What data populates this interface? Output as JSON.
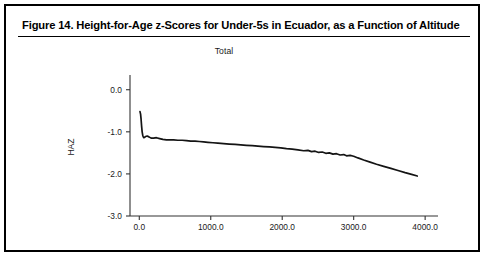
{
  "figure": {
    "title": "Figure 14.  Height-for-Age z-Scores for Under-5s in Ecuador, as a Function of Altitude",
    "subtitle": "Total"
  },
  "chart_data": {
    "type": "line",
    "title": "Total",
    "xlabel": "",
    "ylabel": "HAZ",
    "xlim": [
      -130,
      4180
    ],
    "ylim": [
      -3.0,
      0.35
    ],
    "grid": false,
    "legend": null,
    "xticks": [
      0,
      1000,
      2000,
      3000,
      4000
    ],
    "xtick_labels": [
      "0.0",
      "1000.0",
      "2000.0",
      "3000.0",
      "4000.0"
    ],
    "yticks": [
      0.0,
      -1.0,
      -2.0,
      -3.0
    ],
    "ytick_labels": [
      "0.0",
      "-1.0",
      "-2.0",
      "-3.0"
    ],
    "series": [
      {
        "name": "Total",
        "x": [
          10,
          18,
          25,
          32,
          40,
          48,
          56,
          64,
          75,
          90,
          110,
          135,
          165,
          200,
          240,
          285,
          330,
          380,
          430,
          480,
          540,
          600,
          660,
          720,
          780,
          840,
          900,
          960,
          1030,
          1100,
          1180,
          1260,
          1340,
          1420,
          1500,
          1580,
          1660,
          1740,
          1820,
          1900,
          1980,
          2060,
          2140,
          2220,
          2300,
          2360,
          2410,
          2460,
          2510,
          2560,
          2610,
          2660,
          2710,
          2760,
          2810,
          2860,
          2900,
          2950,
          3000,
          3060,
          3140,
          3230,
          3320,
          3420,
          3520,
          3620,
          3720,
          3810,
          3890
        ],
        "y": [
          -0.52,
          -0.58,
          -0.7,
          -0.86,
          -1.0,
          -1.08,
          -1.12,
          -1.14,
          -1.13,
          -1.11,
          -1.1,
          -1.12,
          -1.15,
          -1.15,
          -1.14,
          -1.16,
          -1.18,
          -1.19,
          -1.19,
          -1.19,
          -1.2,
          -1.2,
          -1.21,
          -1.22,
          -1.22,
          -1.23,
          -1.24,
          -1.25,
          -1.26,
          -1.27,
          -1.28,
          -1.29,
          -1.3,
          -1.31,
          -1.32,
          -1.33,
          -1.34,
          -1.35,
          -1.36,
          -1.37,
          -1.38,
          -1.4,
          -1.41,
          -1.43,
          -1.45,
          -1.44,
          -1.47,
          -1.46,
          -1.49,
          -1.48,
          -1.51,
          -1.5,
          -1.53,
          -1.52,
          -1.55,
          -1.54,
          -1.57,
          -1.56,
          -1.58,
          -1.62,
          -1.67,
          -1.72,
          -1.77,
          -1.82,
          -1.87,
          -1.92,
          -1.97,
          -2.01,
          -2.05
        ]
      }
    ]
  }
}
